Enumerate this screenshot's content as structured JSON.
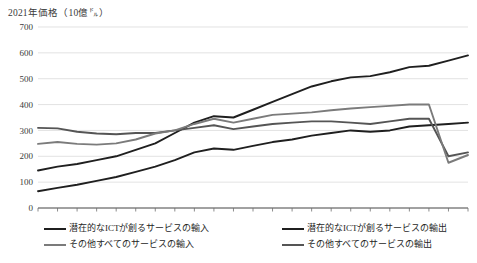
{
  "chart": {
    "axis_title": "2021年価格（10億㌦）",
    "ylabel": "2021年価格（10億㌦）",
    "xlabel": ""
  },
  "legend": {
    "items": [
      {
        "label": "潜在的なICTが創るサービスの輸入",
        "color": "#1f1f1f",
        "column": "left"
      },
      {
        "label": "その他すべてのサービスの輸入",
        "color": "#7b7b7b",
        "column": "left"
      },
      {
        "label": "潜在的なICTが創るサービスの輸出",
        "color": "#1f1f1f",
        "column": "right"
      },
      {
        "label": "その他すべてのサービスの輸出",
        "color": "#555555",
        "column": "right"
      }
    ]
  },
  "chart_data": {
    "type": "line",
    "title": "",
    "xlabel": "",
    "ylabel": "2021年価格（10億㌦）",
    "ylim": [
      0,
      700
    ],
    "yticks": [
      0,
      100,
      200,
      300,
      400,
      500,
      600,
      700
    ],
    "xlim": [
      1999,
      2021
    ],
    "x": [
      1999,
      2000,
      2001,
      2002,
      2003,
      2004,
      2005,
      2006,
      2007,
      2008,
      2009,
      2010,
      2011,
      2012,
      2013,
      2014,
      2015,
      2016,
      2017,
      2018,
      2019,
      2020,
      2021
    ],
    "xticks": [
      1999,
      2001,
      2003,
      2005,
      2007,
      2009,
      2011,
      2013,
      2015,
      2017,
      2019,
      2021
    ],
    "grid": true,
    "legend_position": "bottom",
    "series": [
      {
        "name": "潜在的なICTが創るサービスの輸出",
        "color": "#1f1f1f",
        "values": [
          145,
          160,
          170,
          185,
          200,
          225,
          250,
          290,
          330,
          355,
          350,
          380,
          410,
          440,
          470,
          490,
          505,
          510,
          525,
          545,
          550,
          570,
          590
        ]
      },
      {
        "name": "潜在的なICTが創るサービスの輸入",
        "color": "#1f1f1f",
        "values": [
          65,
          78,
          90,
          105,
          120,
          140,
          160,
          185,
          215,
          230,
          225,
          240,
          255,
          265,
          280,
          290,
          300,
          295,
          300,
          315,
          320,
          325,
          330
        ]
      },
      {
        "name": "その他すべてのサービスの輸出",
        "color": "#555555",
        "values": [
          310,
          308,
          295,
          288,
          285,
          290,
          290,
          300,
          310,
          320,
          305,
          315,
          325,
          330,
          335,
          335,
          330,
          325,
          335,
          345,
          345,
          200,
          215
        ]
      },
      {
        "name": "その他すべてのサービスの輸入",
        "color": "#7b7b7b",
        "values": [
          248,
          255,
          248,
          245,
          250,
          265,
          288,
          300,
          325,
          345,
          330,
          345,
          360,
          365,
          370,
          378,
          385,
          390,
          395,
          400,
          400,
          175,
          205
        ]
      }
    ]
  }
}
